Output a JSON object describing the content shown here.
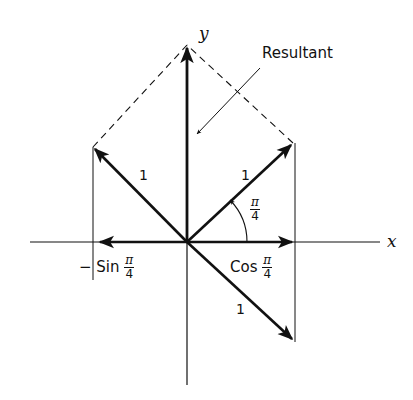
{
  "diagram": {
    "axes": {
      "x_label": "x",
      "y_label": "y"
    },
    "resultant_label": "Resultant",
    "vector_labels": {
      "upper_left": "1",
      "upper_right": "1",
      "lower_right": "1"
    },
    "angle_label": {
      "num": "π",
      "den": "4"
    },
    "projection_labels": {
      "neg_sin": {
        "prefix": "− Sin",
        "num": "π",
        "den": "4"
      },
      "cos": {
        "prefix": "Cos",
        "num": "π",
        "den": "4"
      }
    },
    "colors": {
      "ink": "#111111",
      "background": "#ffffff"
    }
  }
}
